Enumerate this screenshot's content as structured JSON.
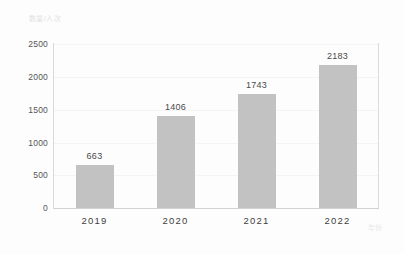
{
  "chart_data": {
    "type": "bar",
    "title": "",
    "subtitle": "",
    "xlabel": "年份",
    "ylabel": "数量/人次",
    "categories": [
      "2019",
      "2020",
      "2021",
      "2022"
    ],
    "values": [
      663,
      1406,
      1743,
      2183
    ],
    "series": [
      {
        "name": "",
        "values": [
          663,
          1406,
          1743,
          2183
        ]
      }
    ],
    "value_labels": [
      "663",
      "1406",
      "1743",
      "2183"
    ],
    "ylim": [
      0,
      2500
    ],
    "yticks": [
      0,
      500,
      1000,
      1500,
      2000,
      2500
    ],
    "ytick_labels": [
      "0",
      "500",
      "1000",
      "1500",
      "2000",
      "2500"
    ],
    "xtick_labels": [
      "2019",
      "2020",
      "2021",
      "2022"
    ],
    "grid": true,
    "grid_axis": "y",
    "legend": false,
    "legend_position": "none",
    "bar_color": "#c2c2c2",
    "axis_color": "#d9d9d9",
    "gridline_color": "#f4f4f4",
    "value_label_color": "#4a4a4a",
    "tick_label_color": "#3d3d3d",
    "axis_title_color": "#e2e2e2",
    "background_color": "#fdfdfd"
  }
}
